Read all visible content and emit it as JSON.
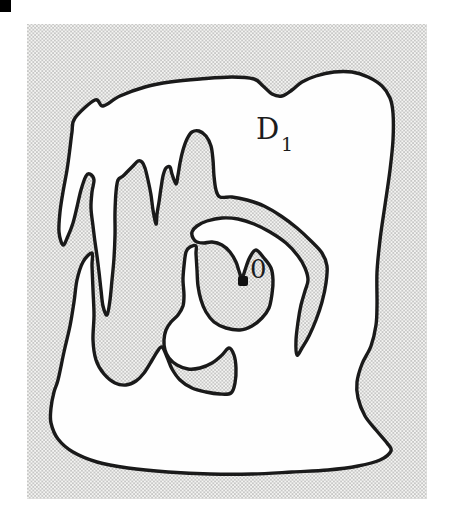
{
  "figure": {
    "canvas": {
      "width": 454,
      "height": 507
    },
    "frame": {
      "x": 27,
      "y": 24,
      "width": 400,
      "height": 475
    },
    "corner_mark": {
      "x": 0,
      "y": 0,
      "width": 11,
      "height": 12
    },
    "labels": {
      "domain": {
        "text": "D",
        "x": 256,
        "y": 139,
        "font_size": 29
      },
      "domain_subscript": {
        "text": "1",
        "x": 281,
        "y": 151,
        "font_size": 19
      },
      "origin": {
        "text": "0",
        "x": 250,
        "y": 278,
        "font_size": 26
      }
    },
    "origin_marker": {
      "x": 238,
      "y": 276,
      "width": 10,
      "height": 10
    },
    "style": {
      "page_color": "#ffffff",
      "domain_fill": "#fefefe",
      "boundary_color": "#1a1a1a",
      "boundary_width": 3.4,
      "stipple_dot_color": "#8f8f8f",
      "stipple_bg_color": "#f4f4f2",
      "stipple_pitch": 3.6,
      "stipple_dot_radius": 0.72
    },
    "boundary_points": [
      [
        75,
        118
      ],
      [
        95,
        100
      ],
      [
        103,
        106
      ],
      [
        120,
        96
      ],
      [
        145,
        87
      ],
      [
        170,
        82
      ],
      [
        200,
        79
      ],
      [
        232,
        77
      ],
      [
        254,
        79
      ],
      [
        263,
        86
      ],
      [
        272,
        94
      ],
      [
        282,
        96
      ],
      [
        292,
        90
      ],
      [
        302,
        82
      ],
      [
        316,
        76
      ],
      [
        334,
        72
      ],
      [
        352,
        72
      ],
      [
        368,
        77
      ],
      [
        382,
        86
      ],
      [
        390,
        98
      ],
      [
        393,
        113
      ],
      [
        393,
        140
      ],
      [
        390,
        170
      ],
      [
        385,
        205
      ],
      [
        380,
        240
      ],
      [
        377,
        272
      ],
      [
        377,
        305
      ],
      [
        376,
        325
      ],
      [
        371,
        346
      ],
      [
        362,
        364
      ],
      [
        357,
        382
      ],
      [
        358,
        398
      ],
      [
        365,
        416
      ],
      [
        376,
        430
      ],
      [
        387,
        443
      ],
      [
        391,
        451
      ],
      [
        380,
        460
      ],
      [
        358,
        466
      ],
      [
        328,
        470
      ],
      [
        292,
        472
      ],
      [
        252,
        474
      ],
      [
        210,
        474
      ],
      [
        168,
        472
      ],
      [
        128,
        468
      ],
      [
        97,
        462
      ],
      [
        73,
        452
      ],
      [
        58,
        439
      ],
      [
        51,
        423
      ],
      [
        51,
        408
      ],
      [
        54,
        392
      ],
      [
        58,
        380
      ],
      [
        64,
        352
      ],
      [
        70,
        326
      ],
      [
        74,
        302
      ],
      [
        77,
        280
      ],
      [
        83,
        262
      ],
      [
        92,
        253
      ],
      [
        92,
        266
      ],
      [
        93,
        290
      ],
      [
        94,
        315
      ],
      [
        93,
        340
      ],
      [
        96,
        360
      ],
      [
        104,
        374
      ],
      [
        115,
        383
      ],
      [
        126,
        385
      ],
      [
        136,
        381
      ],
      [
        144,
        373
      ],
      [
        151,
        362
      ],
      [
        157,
        352
      ],
      [
        162,
        347
      ],
      [
        167,
        357
      ],
      [
        172,
        369
      ],
      [
        180,
        380
      ],
      [
        192,
        388
      ],
      [
        206,
        392
      ],
      [
        220,
        394
      ],
      [
        231,
        393
      ],
      [
        235,
        383
      ],
      [
        236,
        368
      ],
      [
        234,
        355
      ],
      [
        229,
        348
      ],
      [
        222,
        355
      ],
      [
        212,
        363
      ],
      [
        200,
        368
      ],
      [
        188,
        369
      ],
      [
        177,
        365
      ],
      [
        169,
        358
      ],
      [
        165,
        350
      ],
      [
        164,
        340
      ],
      [
        166,
        330
      ],
      [
        171,
        322
      ],
      [
        178,
        315
      ],
      [
        183,
        306
      ],
      [
        184,
        295
      ],
      [
        183,
        280
      ],
      [
        184,
        266
      ],
      [
        186,
        252
      ],
      [
        190,
        247
      ],
      [
        196,
        246
      ],
      [
        196,
        254
      ],
      [
        197,
        270
      ],
      [
        198,
        286
      ],
      [
        201,
        300
      ],
      [
        206,
        312
      ],
      [
        214,
        322
      ],
      [
        226,
        328
      ],
      [
        240,
        330
      ],
      [
        252,
        326
      ],
      [
        262,
        318
      ],
      [
        269,
        308
      ],
      [
        272,
        294
      ],
      [
        273,
        280
      ],
      [
        271,
        268
      ],
      [
        264,
        258
      ],
      [
        256,
        250
      ],
      [
        250,
        257
      ],
      [
        246,
        267
      ],
      [
        242,
        278
      ],
      [
        239,
        271
      ],
      [
        236,
        262
      ],
      [
        230,
        252
      ],
      [
        222,
        245
      ],
      [
        212,
        242
      ],
      [
        204,
        243
      ],
      [
        197,
        242
      ],
      [
        193,
        238
      ],
      [
        192,
        232
      ],
      [
        197,
        226
      ],
      [
        207,
        221
      ],
      [
        222,
        218
      ],
      [
        238,
        219
      ],
      [
        254,
        224
      ],
      [
        270,
        232
      ],
      [
        286,
        243
      ],
      [
        298,
        256
      ],
      [
        305,
        268
      ],
      [
        308,
        280
      ],
      [
        305,
        291
      ],
      [
        301,
        305
      ],
      [
        298,
        322
      ],
      [
        296,
        340
      ],
      [
        297,
        355
      ],
      [
        302,
        348
      ],
      [
        309,
        336
      ],
      [
        316,
        320
      ],
      [
        322,
        302
      ],
      [
        326,
        283
      ],
      [
        327,
        266
      ],
      [
        322,
        253
      ],
      [
        311,
        241
      ],
      [
        297,
        228
      ],
      [
        281,
        216
      ],
      [
        264,
        206
      ],
      [
        247,
        200
      ],
      [
        232,
        197
      ],
      [
        220,
        197
      ],
      [
        216,
        190
      ],
      [
        214,
        176
      ],
      [
        213,
        160
      ],
      [
        211,
        146
      ],
      [
        206,
        136
      ],
      [
        199,
        131
      ],
      [
        192,
        132
      ],
      [
        187,
        139
      ],
      [
        183,
        150
      ],
      [
        180,
        163
      ],
      [
        178,
        175
      ],
      [
        176,
        184
      ],
      [
        172,
        174
      ],
      [
        170,
        167
      ],
      [
        166,
        168
      ],
      [
        163,
        176
      ],
      [
        161,
        188
      ],
      [
        159,
        202
      ],
      [
        157,
        214
      ],
      [
        156,
        224
      ],
      [
        153,
        210
      ],
      [
        151,
        195
      ],
      [
        148,
        180
      ],
      [
        145,
        168
      ],
      [
        142,
        162
      ],
      [
        138,
        161
      ],
      [
        133,
        166
      ],
      [
        128,
        171
      ],
      [
        123,
        176
      ],
      [
        118,
        180
      ],
      [
        116,
        192
      ],
      [
        115,
        212
      ],
      [
        115,
        235
      ],
      [
        114,
        258
      ],
      [
        112,
        280
      ],
      [
        110,
        300
      ],
      [
        107,
        315
      ],
      [
        103,
        306
      ],
      [
        101,
        290
      ],
      [
        99,
        272
      ],
      [
        97,
        256
      ],
      [
        95,
        242
      ],
      [
        93,
        226
      ],
      [
        91,
        208
      ],
      [
        92,
        192
      ],
      [
        94,
        180
      ],
      [
        90,
        174
      ],
      [
        86,
        176
      ],
      [
        81,
        190
      ],
      [
        77,
        207
      ],
      [
        73,
        223
      ],
      [
        68,
        236
      ],
      [
        63,
        245
      ],
      [
        59,
        232
      ],
      [
        60,
        212
      ],
      [
        63,
        192
      ],
      [
        67,
        170
      ],
      [
        70,
        148
      ],
      [
        72,
        132
      ]
    ]
  }
}
